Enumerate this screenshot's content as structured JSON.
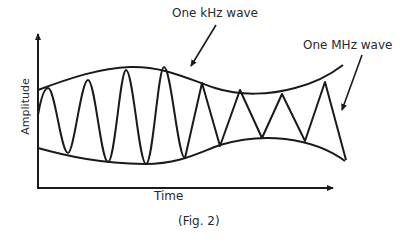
{
  "figure": {
    "caption": "(Fig. 2)",
    "labels": {
      "carrier": "One MHz wave",
      "modulation": "One kHz wave",
      "x_axis": "Time",
      "y_axis": "Amplitude"
    },
    "colors": {
      "line": "#1a1a1a",
      "background": "#ffffff",
      "text": "#2a2a2a"
    }
  }
}
